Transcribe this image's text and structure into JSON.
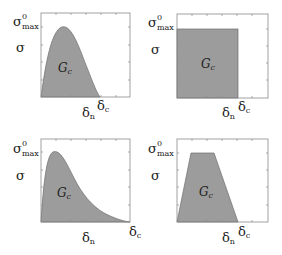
{
  "figure": {
    "panels": [
      {
        "id": "top-left",
        "shape": "smooth-hump",
        "y_label": "σ",
        "y_max_label": "σ",
        "y_max_sup": "0",
        "y_max_sub": "max",
        "area_label": "G",
        "area_sub": "c",
        "dn_label": "δ",
        "dn_sub": "n",
        "dc_label": "δ",
        "dc_sub": "c"
      },
      {
        "id": "top-right",
        "shape": "rectangle",
        "y_label": "σ",
        "y_max_label": "σ",
        "y_max_sup": "0",
        "y_max_sub": "max",
        "area_label": "G",
        "area_sub": "c",
        "dn_label": "δ",
        "dn_sub": "n",
        "dc_label": "δ",
        "dc_sub": "c"
      },
      {
        "id": "bottom-left",
        "shape": "exponential-decay",
        "y_label": "σ",
        "y_max_label": "σ",
        "y_max_sup": "0",
        "y_max_sub": "max",
        "area_label": "G",
        "area_sub": "c",
        "dn_label": "δ",
        "dn_sub": "n",
        "dc_label": "δ",
        "dc_sub": "c"
      },
      {
        "id": "bottom-right",
        "shape": "trapezoid",
        "y_label": "σ",
        "y_max_label": "σ",
        "y_max_sup": "0",
        "y_max_sub": "max",
        "area_label": "G",
        "area_sub": "c",
        "dn_label": "δ",
        "dn_sub": "n",
        "dc_label": "δ",
        "dc_sub": "c"
      }
    ],
    "colors": {
      "fill": "#9c9c9c",
      "outline": "#6e6e6e",
      "frame": "#8a8a8a"
    }
  }
}
